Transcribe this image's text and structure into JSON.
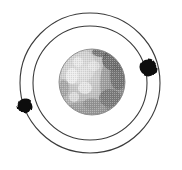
{
  "figure": {
    "name": "planet-with-two-orbiting-moons",
    "background_color": "#ffffff",
    "width": 182,
    "height": 170
  },
  "planet": {
    "name": "planet",
    "center_x": 92,
    "center_y": 82,
    "radius": 33,
    "base_color": "#b9b9b9",
    "light_color": "#f2f2f2",
    "mid_color": "#9a9a9a",
    "dark_color": "#3a3a3a",
    "edge_color": "#8a8a8a",
    "surface_features": [
      {
        "name": "dark-region-upper-right",
        "cx": 115,
        "cy": 60,
        "rx": 13,
        "ry": 11,
        "shade": "#2e2e2e"
      },
      {
        "name": "dark-region-right-limb",
        "cx": 118,
        "cy": 76,
        "rx": 8,
        "ry": 14,
        "shade": "#474747"
      },
      {
        "name": "dark-region-lower-right",
        "cx": 110,
        "cy": 98,
        "rx": 11,
        "ry": 9,
        "shade": "#5c5c5c"
      },
      {
        "name": "dark-region-top-edge",
        "cx": 101,
        "cy": 52,
        "rx": 9,
        "ry": 5,
        "shade": "#3f3f3f"
      },
      {
        "name": "bright-highlight-left",
        "cx": 72,
        "cy": 76,
        "rx": 6,
        "ry": 8,
        "shade": "#f6f6f6"
      },
      {
        "name": "bright-highlight-center",
        "cx": 85,
        "cy": 88,
        "rx": 7,
        "ry": 6,
        "shade": "#f4f4f4"
      },
      {
        "name": "bright-highlight-upper-left",
        "cx": 78,
        "cy": 62,
        "rx": 5,
        "ry": 5,
        "shade": "#ededed"
      },
      {
        "name": "bright-highlight-lower-left",
        "cx": 74,
        "cy": 97,
        "rx": 5,
        "ry": 5,
        "shade": "#ebebeb"
      },
      {
        "name": "bright-highlight-upper-center",
        "cx": 94,
        "cy": 66,
        "rx": 6,
        "ry": 5,
        "shade": "#e8e8e8"
      },
      {
        "name": "gray-patch-lower-center",
        "cx": 92,
        "cy": 104,
        "rx": 9,
        "ry": 6,
        "shade": "#8d8d8d"
      },
      {
        "name": "gray-patch-left-limb",
        "cx": 64,
        "cy": 88,
        "rx": 5,
        "ry": 9,
        "shade": "#979797"
      }
    ]
  },
  "orbits": [
    {
      "name": "outer-orbit",
      "center_x": 90,
      "center_y": 83,
      "radius": 70,
      "stroke_color": "#3b3b3b",
      "stroke_width": 1.1
    },
    {
      "name": "inner-orbit",
      "center_x": 90,
      "center_y": 83,
      "radius": 57,
      "stroke_color": "#3b3b3b",
      "stroke_width": 1.1
    }
  ],
  "moons": [
    {
      "name": "moon-right",
      "label": "outer moon right",
      "center_x": 148,
      "center_y": 68,
      "radius": 8.5,
      "fill_color": "#0d0d0d",
      "on_orbit": "inner-orbit"
    },
    {
      "name": "moon-left",
      "label": "outer moon left",
      "center_x": 25,
      "center_y": 106,
      "radius": 7.5,
      "fill_color": "#0d0d0d",
      "on_orbit": "outer-orbit"
    }
  ]
}
